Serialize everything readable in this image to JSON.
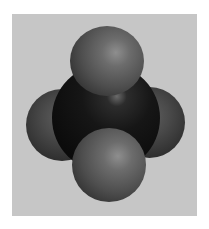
{
  "image": {
    "subject": "space-filling molecular model",
    "description": "Tetrahedral molecule with a large dark central atom bonded to four smaller grey atoms",
    "colors": {
      "page_background": "#ffffff",
      "frame_background": "#c6c6c6",
      "central_atom": "#0c0c0c",
      "outer_atoms": "#5a5a5a"
    },
    "atoms": [
      {
        "id": "central",
        "label": "central atom"
      },
      {
        "id": "top",
        "label": "top outer atom"
      },
      {
        "id": "left",
        "label": "left outer atom"
      },
      {
        "id": "right",
        "label": "right outer atom"
      },
      {
        "id": "bottom",
        "label": "bottom outer atom"
      }
    ]
  }
}
